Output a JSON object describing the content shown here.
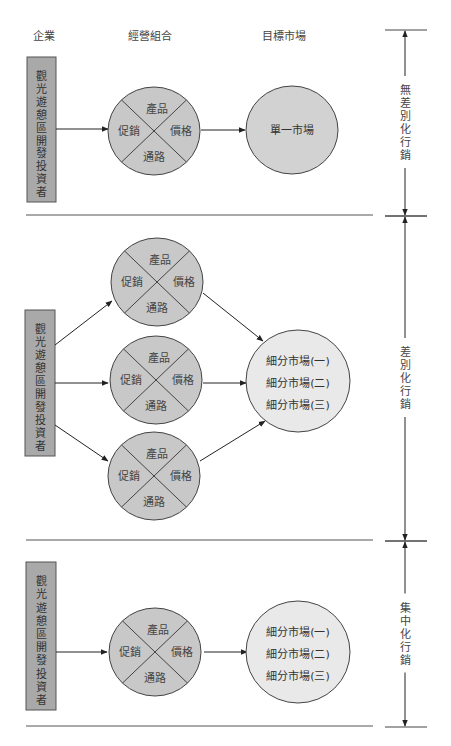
{
  "headers": {
    "company": "企業",
    "mix": "經營組合",
    "target": "目標市場"
  },
  "company_label": [
    "觀",
    "光",
    "遊",
    "憩",
    "區",
    "開",
    "發",
    "投",
    "資",
    "者"
  ],
  "mix_quadrants": {
    "top": "產品",
    "left": "促銷",
    "right": "價格",
    "bottom": "通路"
  },
  "single_market": "單一市場",
  "segment_markets": [
    "細分市場(一)",
    "細分市場(二)",
    "細分市場(三)"
  ],
  "strategies": [
    {
      "name": "undifferentiated",
      "label": [
        "無",
        "差",
        "別",
        "化",
        "行",
        "銷"
      ]
    },
    {
      "name": "differentiated",
      "label": [
        "差",
        "別",
        "化",
        "行",
        "銷"
      ]
    },
    {
      "name": "concentrated",
      "label": [
        "集",
        "中",
        "化",
        "行",
        "銷"
      ]
    }
  ],
  "colors": {
    "company_box": "#a9a9a9",
    "mix_circle": "#c8c8c8",
    "single_market": "#d2d2d2",
    "segment_market": "#e9e9e9",
    "line": "#222222",
    "divider": "#555555"
  }
}
